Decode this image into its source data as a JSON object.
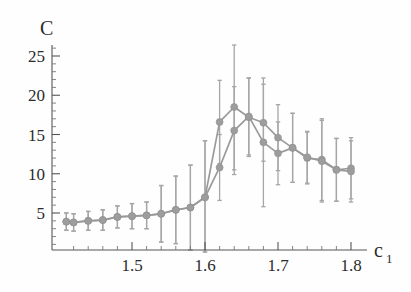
{
  "chart_data": {
    "type": "line",
    "title": "",
    "xlabel": "c_1",
    "xlabel_base": "c",
    "xlabel_sub": "1",
    "ylabel": "C",
    "xlim": [
      1.405,
      1.805
    ],
    "ylim": [
      0,
      27.5
    ],
    "grid": false,
    "legend": null,
    "x_ticks": [
      1.5,
      1.6,
      1.7,
      1.8
    ],
    "x_tick_labels": [
      "1.5",
      "1.6",
      "1.7",
      "1.8"
    ],
    "x_minor_tick_step": 0.02,
    "y_ticks": [
      5,
      10,
      15,
      20,
      25
    ],
    "y_tick_labels": [
      "5",
      "10",
      "15",
      "20",
      "25"
    ],
    "y_minor_tick_step": 1,
    "marker_color": "#9d9d9d",
    "line_color": "#9a9a9a",
    "errorbar_color": "#a6a6a6",
    "axis_color": "#555555",
    "series": [
      {
        "name": "series-1",
        "x": [
          1.41,
          1.42,
          1.44,
          1.46,
          1.48,
          1.5,
          1.52,
          1.54,
          1.56,
          1.58,
          1.6,
          1.62,
          1.64,
          1.66,
          1.68,
          1.7,
          1.72,
          1.74,
          1.76,
          1.78,
          1.8
        ],
        "y": [
          3.9,
          3.8,
          4.0,
          4.1,
          4.5,
          4.6,
          4.7,
          4.9,
          5.4,
          5.7,
          7.0,
          16.6,
          18.5,
          17.2,
          16.5,
          14.6,
          13.3,
          12.0,
          11.8,
          10.5,
          10.7
        ],
        "yerr": [
          1.1,
          1.1,
          1.2,
          1.3,
          1.4,
          1.6,
          1.7,
          3.6,
          4.3,
          5.4,
          7.2,
          5.3,
          8.0,
          5.0,
          4.9,
          4.2,
          4.4,
          3.3,
          5.2,
          4.0,
          3.9
        ]
      },
      {
        "name": "series-2",
        "x": [
          1.41,
          1.42,
          1.44,
          1.46,
          1.48,
          1.5,
          1.52,
          1.54,
          1.56,
          1.58,
          1.6,
          1.62,
          1.64,
          1.66,
          1.68,
          1.7,
          1.72,
          1.74,
          1.76,
          1.78,
          1.8
        ],
        "y": [
          3.9,
          3.8,
          4.0,
          4.1,
          4.5,
          4.6,
          4.7,
          4.9,
          5.4,
          5.7,
          7.0,
          10.8,
          15.5,
          17.3,
          14.0,
          12.6,
          13.3,
          12.1,
          11.6,
          10.5,
          10.3
        ],
        "yerr": [
          1.1,
          1.1,
          1.2,
          1.3,
          1.4,
          1.6,
          1.7,
          3.6,
          4.3,
          5.4,
          7.2,
          4.2,
          5.6,
          4.9,
          8.2,
          4.0,
          4.4,
          3.3,
          5.2,
          4.0,
          3.9
        ]
      }
    ]
  }
}
